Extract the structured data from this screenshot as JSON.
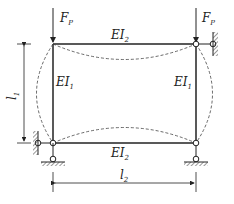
{
  "diagram": {
    "type": "structural frame buckling diagram",
    "loads": [
      {
        "symbol": "F",
        "subscript": "P",
        "position": "top-left joint"
      },
      {
        "symbol": "F",
        "subscript": "P",
        "position": "top-right joint"
      }
    ],
    "members": {
      "top_beam": {
        "symbol": "EI",
        "subscript": "2"
      },
      "bottom_beam": {
        "symbol": "EI",
        "subscript": "2"
      },
      "left_column": {
        "symbol": "EI",
        "subscript": "1"
      },
      "right_column": {
        "symbol": "EI",
        "subscript": "1"
      }
    },
    "dimensions": {
      "height": {
        "symbol": "l",
        "subscript": "1"
      },
      "width": {
        "symbol": "l",
        "subscript": "2"
      }
    },
    "buckled_shape": "dashed"
  }
}
